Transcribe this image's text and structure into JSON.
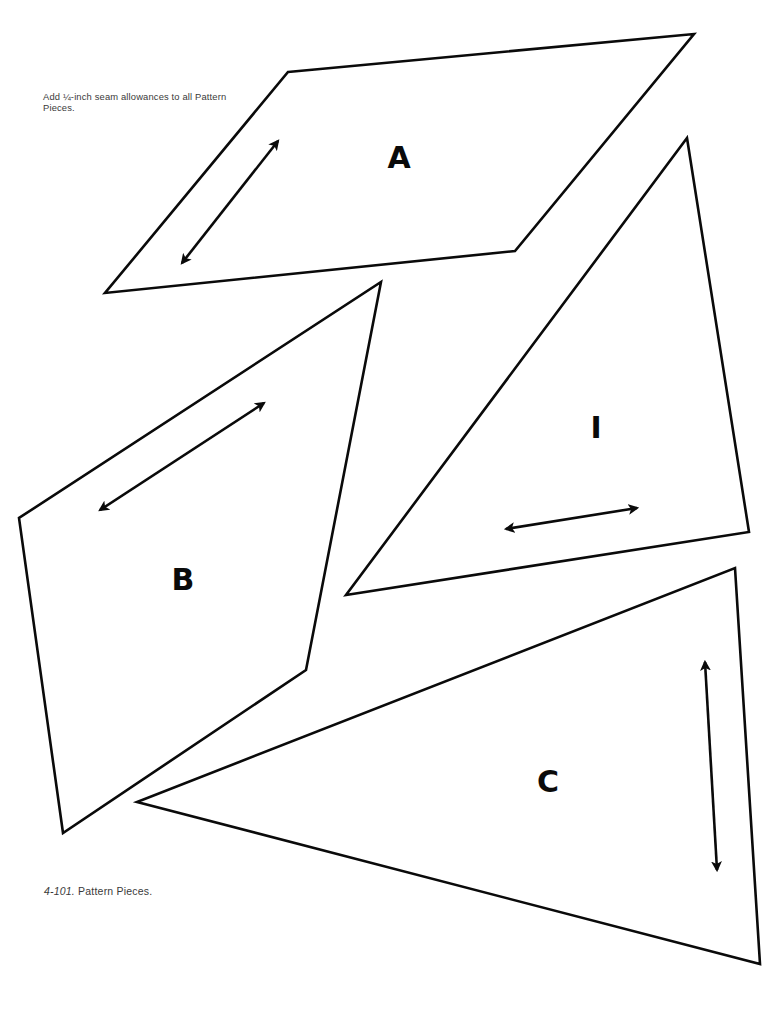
{
  "note": {
    "text": "Add ¼-inch seam allowances to all Pattern Pieces."
  },
  "caption": {
    "figure_number": "4-101.",
    "text": "Pattern Pieces."
  },
  "colors": {
    "line": "#0a0a0a",
    "text": "#3a3a3a",
    "background": "#ffffff"
  },
  "pieces": [
    {
      "label": "A",
      "shape": "parallelogram",
      "points": "288,72 694,34 515,251 105,293",
      "label_pos": [
        399,
        168
      ],
      "grainline": {
        "from": [
          182,
          263
        ],
        "to": [
          278,
          141
        ],
        "icon": "double-arrow"
      }
    },
    {
      "label": "B",
      "shape": "quadrilateral",
      "points": "381,282 306,670 63,833 19,518",
      "label_pos": [
        183,
        590
      ],
      "grainline": {
        "from": [
          100,
          510
        ],
        "to": [
          264,
          403
        ],
        "icon": "double-arrow"
      }
    },
    {
      "label": "I",
      "shape": "triangle",
      "points": "687,138 749,532 346,595",
      "label_pos": [
        596,
        438
      ],
      "grainline": {
        "from": [
          506,
          529
        ],
        "to": [
          637,
          508
        ],
        "icon": "double-arrow"
      }
    },
    {
      "label": "C",
      "shape": "triangle",
      "points": "735,568 760,964 137,802",
      "label_pos": [
        548,
        792
      ],
      "grainline": {
        "from": [
          705,
          662
        ],
        "to": [
          717,
          870
        ],
        "icon": "double-arrow"
      }
    }
  ]
}
